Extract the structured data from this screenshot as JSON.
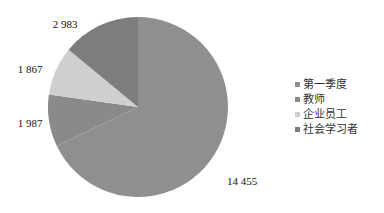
{
  "chart_data": {
    "type": "pie",
    "title": "",
    "categories": [
      "第一季度",
      "教师",
      "企业员工",
      "社会学习者"
    ],
    "values": [
      14455,
      1987,
      1867,
      2983
    ],
    "labels": [
      "14 455",
      "1 987",
      "1 867",
      "2 983"
    ],
    "colors": [
      "#8f8f8f",
      "#8a8a8a",
      "#cfcfcf",
      "#7d7d7d"
    ],
    "start_angle": "12 o'clock",
    "direction": "clockwise",
    "legend_position": "right"
  },
  "legend": {
    "items": [
      {
        "label": "第一季度",
        "color": "#8f8f8f"
      },
      {
        "label": "教师",
        "color": "#8a8a8a"
      },
      {
        "label": "企业员工",
        "color": "#cfcfcf"
      },
      {
        "label": "社会学习者",
        "color": "#7d7d7d"
      }
    ]
  }
}
